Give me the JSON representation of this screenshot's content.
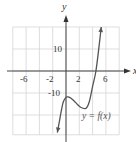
{
  "chart_data": {
    "type": "line",
    "title": "",
    "xlabel": "x",
    "ylabel": "y",
    "xlim": [
      -8,
      8
    ],
    "ylim": [
      -30,
      20
    ],
    "grid": true,
    "x_ticks": [
      -6,
      -2,
      2,
      6
    ],
    "x_tick_labels": [
      "-6",
      "-2",
      "2",
      "6"
    ],
    "y_ticks": [
      10,
      -10
    ],
    "y_tick_labels": [
      "10",
      "-10"
    ],
    "x_grid_step": 2,
    "y_grid_step": 10,
    "series": [
      {
        "name": "y = f(x)",
        "annotation": "y = f(x)",
        "x": [
          -1.3,
          -1.0,
          -0.7,
          -0.4,
          0.0,
          0.3,
          0.8,
          1.5,
          2.2,
          3.0,
          3.5,
          4.0,
          4.5,
          5.0,
          5.3
        ],
        "y": [
          -28,
          -23,
          -18,
          -14,
          -12,
          -11.8,
          -12.5,
          -14.5,
          -16.5,
          -17,
          -14,
          -7,
          0,
          12,
          20
        ],
        "arrows": "both"
      }
    ],
    "colors": {
      "curve": "#555555",
      "axis": "#444444",
      "grid": "#d0d0d0"
    }
  },
  "labels": {
    "y_axis": "y",
    "x_axis": "x",
    "curve": "y = f(x)",
    "tick_neg6": "-6",
    "tick_neg2": "-2",
    "tick_2": "2",
    "tick_6": "6",
    "tick_10": "10",
    "tick_neg10": "-10"
  }
}
